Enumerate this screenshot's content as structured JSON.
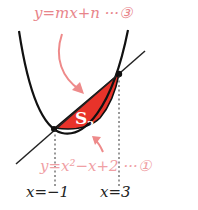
{
  "diagram": {
    "line_equation": "y=mx+n ···③",
    "parabola_equation": "y=x²−x+2 ···①",
    "region_label": "S",
    "region_label_subscript": "2",
    "x_markers": [
      "x=−1",
      "x=3"
    ],
    "colors": {
      "region_fill": "#e8332a",
      "label_pink": "#e8848a",
      "curve": "#111111",
      "arrow": "#ee8a8a"
    }
  }
}
